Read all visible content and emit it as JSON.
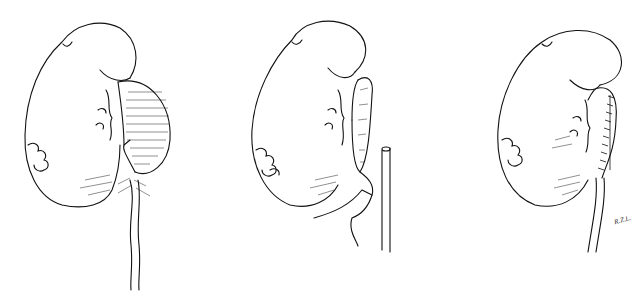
{
  "figure": {
    "panels": [
      {
        "id": "panel-1",
        "subject": "kidney with dilated renal pelvis, incision line marked"
      },
      {
        "id": "panel-2",
        "subject": "kidney with opened pelvis and ureter transected"
      },
      {
        "id": "panel-3",
        "subject": "kidney after pyeloplasty with sutured pelvis and ureter"
      }
    ],
    "signature": "R.Z.L.",
    "colors": {
      "ink": "#111111",
      "background": "#ffffff"
    }
  }
}
